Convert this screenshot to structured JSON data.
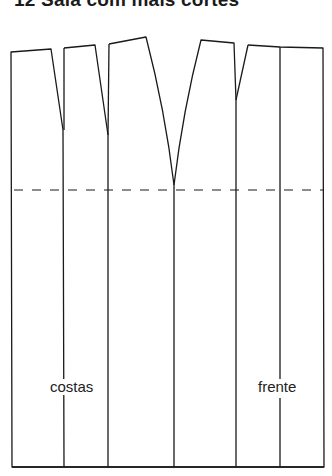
{
  "title": "12 Saia com mais cortes",
  "labels": {
    "back": "costas",
    "front": "frente"
  },
  "colors": {
    "line": "#1a1a1a",
    "background": "#ffffff"
  },
  "diagram": {
    "type": "sewing-pattern",
    "hip_line": "dashed"
  }
}
